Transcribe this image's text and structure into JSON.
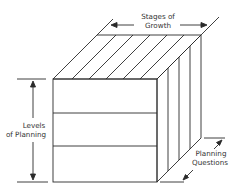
{
  "diagram": {
    "type": "3d-cube",
    "labels": {
      "top_axis": [
        "Stages of",
        "Growth"
      ],
      "left_axis": [
        "Levels",
        "of Planning"
      ],
      "depth_axis": [
        "Planning",
        "Questions"
      ]
    },
    "front_face_rows": 3,
    "top_face_slices": 7,
    "side_face_slices": 4,
    "colors": {
      "line": "#2a2a2a",
      "text": "#333333",
      "background": "#ffffff"
    }
  }
}
